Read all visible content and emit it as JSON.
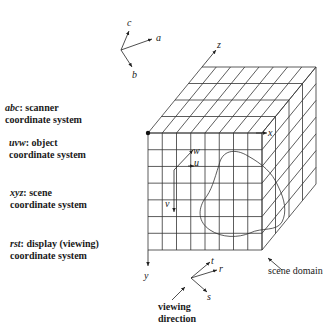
{
  "diagram": {
    "type": "3D coordinate systems illustration",
    "legend": [
      {
        "symbol": "abc",
        "desc": ": scanner",
        "line2": "coordinate system"
      },
      {
        "symbol": "uvw",
        "desc": ": object",
        "line2": "coordinate system"
      },
      {
        "symbol": "xyz",
        "desc": ": scene",
        "line2": "coordinate system"
      },
      {
        "symbol": "rst",
        "desc": ": display (viewing)",
        "line2": "coordinate system"
      }
    ],
    "scanner_axes": {
      "a": "a",
      "b": "b",
      "c": "c"
    },
    "scene_axes": {
      "x": "x",
      "y": "y",
      "z": "z"
    },
    "object_axes": {
      "u": "u",
      "v": "v",
      "w": "w"
    },
    "display_axes": {
      "r": "r",
      "s": "s",
      "t": "t"
    },
    "annotations": {
      "scene_domain": "scene domain",
      "viewing_line1": "viewing",
      "viewing_line2": "direction"
    },
    "grid": {
      "front_columns": 8,
      "front_rows": 7,
      "depth_slices": 4
    },
    "colors": {
      "line": "#333333",
      "background": "#ffffff"
    }
  }
}
